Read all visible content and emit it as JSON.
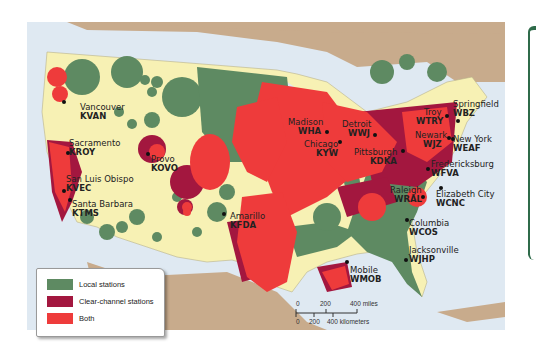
{
  "map": {
    "title": "Radio station coverage in the United States",
    "colors": {
      "water": "#dfe9f2",
      "land_us": "#f7f1b4",
      "land_other": "#c8ab8c",
      "local": "#5e8a62",
      "clear_channel": "#a3173f",
      "both": "#ee3b3b"
    },
    "legend": {
      "items": [
        {
          "label": "Local stations",
          "color": "#5e8a62"
        },
        {
          "label": "Clear-channel stations",
          "color": "#a3173f"
        },
        {
          "label": "Both",
          "color": "#ee3b3b"
        }
      ]
    },
    "scale": {
      "miles_ticks": [
        "0",
        "200",
        "400 miles"
      ],
      "km_ticks": [
        "0",
        "200",
        "400 kilometers"
      ]
    },
    "stations": [
      {
        "city": "Vancouver",
        "call": "KVAN"
      },
      {
        "city": "Sacramento",
        "call": "KROY"
      },
      {
        "city": "Provo",
        "call": "KOVO"
      },
      {
        "city": "San Luis Obispo",
        "call": "KVEC"
      },
      {
        "city": "Santa Barbara",
        "call": "KTMS"
      },
      {
        "city": "Amarillo",
        "call": "KFDA"
      },
      {
        "city": "Madison",
        "call": "WHA"
      },
      {
        "city": "Detroit",
        "call": "WWJ"
      },
      {
        "city": "Chicago",
        "call": "KYW"
      },
      {
        "city": "Pittsburgh",
        "call": "KDKA"
      },
      {
        "city": "Troy",
        "call": "WTRY"
      },
      {
        "city": "Springfield",
        "call": "WBZ"
      },
      {
        "city": "Newark",
        "call": "WJZ"
      },
      {
        "city": "New York",
        "call": "WEAF"
      },
      {
        "city": "Fredericksburg",
        "call": "WFVA"
      },
      {
        "city": "Raleigh",
        "call": "WRAL"
      },
      {
        "city": "Elizabeth City",
        "call": "WCNC"
      },
      {
        "city": "Columbia",
        "call": "WCOS"
      },
      {
        "city": "Jacksonville",
        "call": "WJHP"
      },
      {
        "city": "Mobile",
        "call": "WMOB"
      }
    ]
  }
}
